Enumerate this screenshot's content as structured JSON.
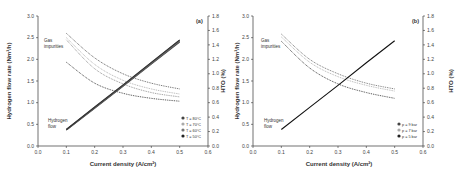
{
  "chart_data": [
    {
      "panel": "(a)",
      "type": "line",
      "title": "",
      "xlabel": "Current density (A/cm²)",
      "ylabel": "Hydrogen flow rate (Nm³/h)",
      "y2label": "HTO (%)",
      "xlim": [
        0.0,
        0.6
      ],
      "ylim": [
        0.0,
        3.0
      ],
      "y2lim": [
        0.0,
        1.8
      ],
      "xticks": [
        "0.0",
        "0.1",
        "0.2",
        "0.3",
        "0.4",
        "0.5",
        "0.6"
      ],
      "yticks": [
        "0.0",
        "0.5",
        "1.0",
        "1.5",
        "2.0",
        "2.5",
        "3.0"
      ],
      "y2ticks": [
        "0.0",
        "0.2",
        "0.4",
        "0.6",
        "0.8",
        "1.0",
        "1.2",
        "1.4",
        "1.6",
        "1.8"
      ],
      "annotations": [
        {
          "text": "Gas",
          "x": 0.04,
          "y": 2.45
        },
        {
          "text": "impurities",
          "x": 0.04,
          "y": 2.3
        },
        {
          "text": "Hydrogen",
          "x": 0.04,
          "y": 0.55
        },
        {
          "text": "flow",
          "x": 0.04,
          "y": 0.4
        }
      ],
      "legend": [
        "T = 80°C",
        "T = 70°C",
        "T = 60°C",
        "T = 50°C"
      ],
      "legend_position": "lower right",
      "grid": false,
      "x": [
        0.1,
        0.2,
        0.3,
        0.4,
        0.5
      ],
      "series": [
        {
          "name": "HTO T = 80°C",
          "axis": "y2",
          "style": "dotted",
          "color": "#555555",
          "values": [
            1.56,
            1.22,
            1.0,
            0.87,
            0.79
          ]
        },
        {
          "name": "HTO T = 70°C",
          "axis": "y2",
          "style": "dotted",
          "color": "#aaaaaa",
          "values": [
            1.5,
            1.13,
            0.91,
            0.79,
            0.72
          ]
        },
        {
          "name": "HTO T = 60°C",
          "axis": "y2",
          "style": "dotted",
          "color": "#888888",
          "values": [
            1.47,
            1.07,
            0.86,
            0.74,
            0.68
          ]
        },
        {
          "name": "HTO T = 50°C",
          "axis": "y2",
          "style": "dotted",
          "color": "#333333",
          "values": [
            1.16,
            0.87,
            0.73,
            0.66,
            0.62
          ]
        },
        {
          "name": "H2 flow T = 80°C",
          "axis": "y",
          "style": "solid",
          "color": "#444444",
          "values": [
            0.37,
            0.87,
            1.38,
            1.89,
            2.4
          ]
        },
        {
          "name": "H2 flow T = 70°C",
          "axis": "y",
          "style": "solid",
          "color": "#666666",
          "values": [
            0.37,
            0.88,
            1.39,
            1.9,
            2.42
          ]
        },
        {
          "name": "H2 flow T = 60°C",
          "axis": "y",
          "style": "solid",
          "color": "#555555",
          "values": [
            0.38,
            0.89,
            1.4,
            1.92,
            2.44
          ]
        },
        {
          "name": "H2 flow T = 50°C",
          "axis": "y",
          "style": "solid",
          "color": "#333333",
          "values": [
            0.38,
            0.9,
            1.41,
            1.93,
            2.45
          ]
        }
      ]
    },
    {
      "panel": "(b)",
      "type": "line",
      "title": "",
      "xlabel": "Current density (A/cm²)",
      "ylabel": "Hydrogen flow rate (Nm³/h)",
      "y2label": "HTO (%)",
      "xlim": [
        0.0,
        0.6
      ],
      "ylim": [
        0.0,
        3.0
      ],
      "y2lim": [
        0.0,
        1.8
      ],
      "xticks": [
        "0.0",
        "0.1",
        "0.2",
        "0.3",
        "0.4",
        "0.5",
        "0.6"
      ],
      "yticks": [
        "0.0",
        "0.5",
        "1.0",
        "1.5",
        "2.0",
        "2.5",
        "3.0"
      ],
      "y2ticks": [
        "0.0",
        "0.2",
        "0.4",
        "0.6",
        "0.8",
        "1.0",
        "1.2",
        "1.4",
        "1.6",
        "1.8"
      ],
      "annotations": [
        {
          "text": "Gas",
          "x": 0.04,
          "y": 2.45
        },
        {
          "text": "impurities",
          "x": 0.04,
          "y": 2.3
        },
        {
          "text": "Hydrogen",
          "x": 0.04,
          "y": 0.55
        },
        {
          "text": "flow",
          "x": 0.04,
          "y": 0.4
        }
      ],
      "legend": [
        "p = 9 bar",
        "p = 7 bar",
        "p = 5 bar"
      ],
      "legend_position": "lower right",
      "grid": false,
      "x": [
        0.1,
        0.2,
        0.3,
        0.4,
        0.5
      ],
      "series": [
        {
          "name": "HTO p = 9 bar",
          "axis": "y2",
          "style": "dotted",
          "color": "#666666",
          "values": [
            1.55,
            1.2,
            1.0,
            0.87,
            0.79
          ]
        },
        {
          "name": "HTO p = 7 bar",
          "axis": "y2",
          "style": "dotted",
          "color": "#aaaaaa",
          "values": [
            1.51,
            1.16,
            0.96,
            0.84,
            0.76
          ]
        },
        {
          "name": "HTO p = 5 bar",
          "axis": "y2",
          "style": "dotted",
          "color": "#333333",
          "values": [
            1.45,
            1.08,
            0.86,
            0.74,
            0.66
          ]
        },
        {
          "name": "H2 flow",
          "axis": "y",
          "style": "solid",
          "color": "#111111",
          "values": [
            0.38,
            0.89,
            1.4,
            1.92,
            2.43
          ]
        }
      ]
    }
  ],
  "panels": {
    "a": {
      "tag": "(a)",
      "ylabel": "Hydrogen flow rate (Nm³/h)",
      "y2label": "HTO (%)",
      "xlabel": "Current density (A/cm²)",
      "gas_label_1": "Gas",
      "gas_label_2": "impurities",
      "h2_label_1": "Hydrogen",
      "h2_label_2": "flow",
      "legend": [
        "T = 80°C",
        "T = 70°C",
        "T = 60°C",
        "T = 50°C"
      ]
    },
    "b": {
      "tag": "(b)",
      "ylabel": "Hydrogen flow rate (Nm³/h)",
      "y2label": "HTO (%)",
      "xlabel": "Current density (A/cm²)",
      "gas_label_1": "Gas",
      "gas_label_2": "impurities",
      "h2_label_1": "Hydrogen",
      "h2_label_2": "flow",
      "legend": [
        "p = 9 bar",
        "p = 7 bar",
        "p = 5 bar"
      ]
    }
  }
}
